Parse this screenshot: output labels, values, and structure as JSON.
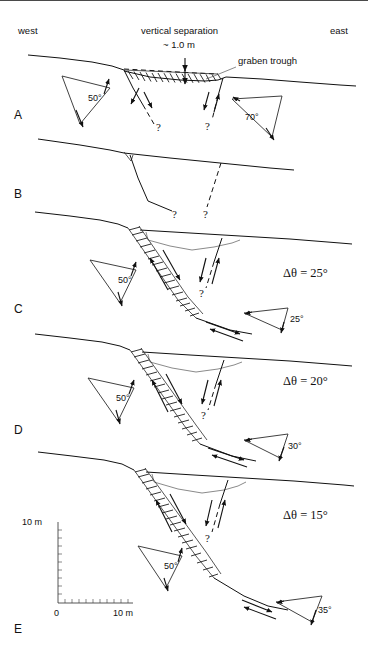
{
  "figure": {
    "orientation": {
      "west_label": "west",
      "east_label": "east"
    },
    "annotations": {
      "vertical_separation_label": "vertical separation",
      "vertical_separation_value": "~ 1.0 m",
      "graben_trough_label": "graben trough",
      "question_mark": "?"
    },
    "scale_bar": {
      "vertical_label": "10 m",
      "origin_label": "0",
      "horizontal_label": "10 m",
      "vertical_ticks": 10,
      "horizontal_ticks": 10
    },
    "panels": [
      {
        "letter": "A",
        "caption_angles": [
          "50°",
          "70°"
        ],
        "delta_theta": null,
        "has_graben_wedge": true,
        "has_hachured_fault": false,
        "notes": "Present-day surface with graben trough and ~1.0 m vertical separation"
      },
      {
        "letter": "B",
        "caption_angles": [],
        "delta_theta": null,
        "has_graben_wedge": false,
        "has_hachured_fault": false,
        "notes": "Restored pre-faulting geometry, single planar surface with incipient fault traces"
      },
      {
        "letter": "C",
        "caption_angles": [
          "50°",
          "25°"
        ],
        "delta_theta": "Δθ = 25°",
        "has_graben_wedge": true,
        "has_hachured_fault": true,
        "notes": "Fault dip refraction of 25 degrees"
      },
      {
        "letter": "D",
        "caption_angles": [
          "50°",
          "30°"
        ],
        "delta_theta": "Δθ = 20°",
        "has_graben_wedge": true,
        "has_hachured_fault": true,
        "notes": "Fault dip refraction of 20 degrees"
      },
      {
        "letter": "E",
        "caption_angles": [
          "50°",
          "35°"
        ],
        "delta_theta": "Δθ = 15°",
        "has_graben_wedge": true,
        "has_hachured_fault": true,
        "notes": "Fault dip refraction of 15 degrees, with scale bar"
      }
    ]
  }
}
